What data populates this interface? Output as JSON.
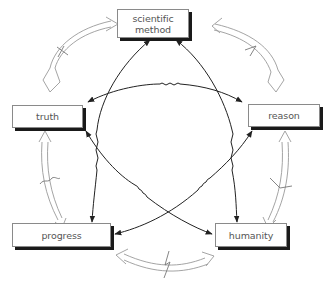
{
  "diagram": {
    "type": "cycle-with-cross-links",
    "nodes": [
      {
        "id": "scientific-method",
        "label_line1": "scientific",
        "label_line2": "method"
      },
      {
        "id": "truth",
        "label": "truth"
      },
      {
        "id": "reason",
        "label": "reason"
      },
      {
        "id": "progress",
        "label": "progress"
      },
      {
        "id": "humanity",
        "label": "humanity"
      }
    ],
    "outer_ring_edges": [
      {
        "from": "scientific-method",
        "to": "truth",
        "style": "hollow-double-arrow",
        "broken": true
      },
      {
        "from": "scientific-method",
        "to": "reason",
        "style": "hollow-double-arrow",
        "broken": true
      },
      {
        "from": "truth",
        "to": "progress",
        "style": "hollow-double-arrow",
        "broken": true
      },
      {
        "from": "reason",
        "to": "humanity",
        "style": "hollow-double-arrow",
        "broken": true
      },
      {
        "from": "progress",
        "to": "humanity",
        "style": "hollow-double-arrow",
        "broken": true
      }
    ],
    "inner_edges": [
      {
        "from": "truth",
        "to": "reason",
        "style": "solid-double-arrow",
        "wavy_segment": true
      },
      {
        "from": "scientific-method",
        "to": "progress",
        "style": "solid-double-arrow",
        "wavy_segment": true
      },
      {
        "from": "scientific-method",
        "to": "humanity",
        "style": "solid-double-arrow",
        "wavy_segment": true
      },
      {
        "from": "truth",
        "to": "humanity",
        "style": "solid-double-arrow",
        "wavy_segment": true
      },
      {
        "from": "reason",
        "to": "progress",
        "style": "solid-double-arrow",
        "wavy_segment": true
      }
    ],
    "colors": {
      "box_border": "#8a8a8a",
      "box_shadow": "#1a1a1a",
      "text": "#555555",
      "arrow_solid": "#222222",
      "arrow_hollow": "#9a9a9a"
    }
  }
}
